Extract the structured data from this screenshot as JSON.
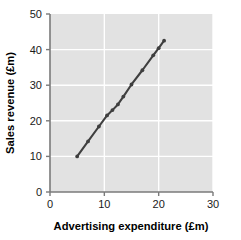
{
  "chart_data": {
    "type": "scatter",
    "title": "",
    "xlabel": "Advertising expenditure (£m)",
    "ylabel": "Sales revenue (£m)",
    "xlim": [
      0,
      30
    ],
    "ylim": [
      0,
      50
    ],
    "xticks": [
      "0",
      "10",
      "20",
      "30"
    ],
    "xtick_values": [
      0,
      10,
      20,
      30
    ],
    "yticks": [
      "0",
      "10",
      "20",
      "30",
      "40",
      "50"
    ],
    "ytick_values": [
      0,
      10,
      20,
      30,
      40,
      50
    ],
    "grid": true,
    "legend": "none",
    "connected": true,
    "marker": "dot",
    "series": [
      {
        "name": "Sales vs advertising",
        "color": "#3f3f3f",
        "x": [
          5.0,
          7.0,
          9.0,
          10.5,
          11.5,
          12.5,
          13.5,
          15.0,
          17.0,
          19.0,
          20.0,
          21.0
        ],
        "y": [
          10.0,
          14.2,
          18.4,
          21.5,
          23.0,
          24.6,
          26.8,
          30.2,
          34.2,
          38.4,
          40.4,
          42.5
        ]
      }
    ],
    "style": {
      "plot_background": "#e2e2e2",
      "gridline_color": "#ffffff",
      "axis_color": "#7a7a7a",
      "text_color": "#1a1a1a",
      "page_background": "#ffffff"
    }
  }
}
